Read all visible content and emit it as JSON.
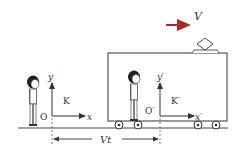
{
  "diagram": {
    "velocity_label": "V",
    "velocity_arrow_color": "#a52a2a",
    "frame_k": {
      "name": "K",
      "origin": "O",
      "x_axis": "x",
      "y_axis": "y"
    },
    "frame_k_prime": {
      "name": "K′",
      "origin": "O′",
      "x_axis": "x′",
      "y_axis": "y′"
    },
    "displacement_label": "Vt",
    "line_color": "#333333"
  }
}
